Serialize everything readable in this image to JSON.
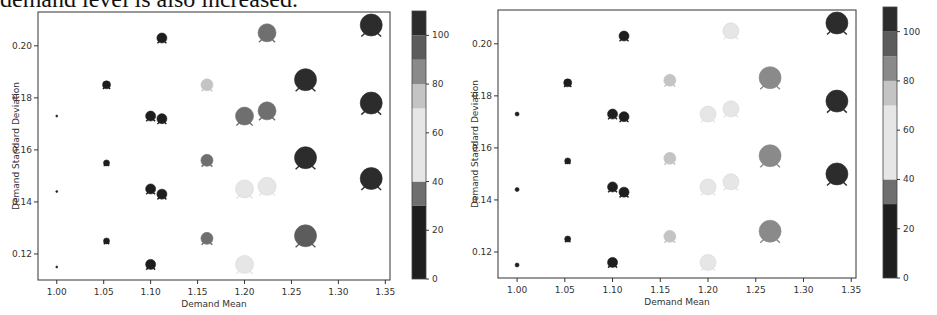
{
  "caption": "demand level is also increased.",
  "chart_data": [
    {
      "type": "scatter",
      "title": "",
      "xlabel": "Demand Mean",
      "ylabel": "Demand Standard Deviation",
      "xlim": [
        0.98,
        1.35
      ],
      "ylim": [
        0.11,
        0.213
      ],
      "xticks": [
        "1.00",
        "1.05",
        "1.10",
        "1.15",
        "1.20",
        "1.25",
        "1.30",
        "1.35"
      ],
      "yticks": [
        "0.12",
        "0.14",
        "0.16",
        "0.18",
        "0.20"
      ],
      "colorbar": {
        "min": 0,
        "max": 110,
        "ticks": [
          "0",
          "20",
          "40",
          "60",
          "80",
          "100"
        ]
      },
      "grid": false,
      "points": [
        {
          "x": 1.0,
          "y": 0.173,
          "value": 0,
          "size": 1
        },
        {
          "x": 1.0,
          "y": 0.144,
          "value": 0,
          "size": 1
        },
        {
          "x": 1.0,
          "y": 0.115,
          "value": 0,
          "size": 1
        },
        {
          "x": 1.053,
          "y": 0.185,
          "value": 15,
          "size": 4
        },
        {
          "x": 1.053,
          "y": 0.155,
          "value": 10,
          "size": 3
        },
        {
          "x": 1.053,
          "y": 0.125,
          "value": 10,
          "size": 3
        },
        {
          "x": 1.1,
          "y": 0.173,
          "value": 15,
          "size": 5
        },
        {
          "x": 1.112,
          "y": 0.172,
          "value": 15,
          "size": 5
        },
        {
          "x": 1.1,
          "y": 0.145,
          "value": 15,
          "size": 5
        },
        {
          "x": 1.112,
          "y": 0.143,
          "value": 15,
          "size": 5
        },
        {
          "x": 1.1,
          "y": 0.116,
          "value": 15,
          "size": 5
        },
        {
          "x": 1.112,
          "y": 0.203,
          "value": 15,
          "size": 5
        },
        {
          "x": 1.16,
          "y": 0.185,
          "value": 70,
          "size": 6
        },
        {
          "x": 1.16,
          "y": 0.156,
          "value": 38,
          "size": 6
        },
        {
          "x": 1.16,
          "y": 0.126,
          "value": 38,
          "size": 6
        },
        {
          "x": 1.2,
          "y": 0.173,
          "value": 35,
          "size": 9
        },
        {
          "x": 1.224,
          "y": 0.175,
          "value": 35,
          "size": 9
        },
        {
          "x": 1.2,
          "y": 0.145,
          "value": 55,
          "size": 9
        },
        {
          "x": 1.224,
          "y": 0.146,
          "value": 55,
          "size": 9
        },
        {
          "x": 1.2,
          "y": 0.116,
          "value": 55,
          "size": 9
        },
        {
          "x": 1.224,
          "y": 0.205,
          "value": 35,
          "size": 9
        },
        {
          "x": 1.265,
          "y": 0.187,
          "value": 100,
          "size": 11
        },
        {
          "x": 1.265,
          "y": 0.157,
          "value": 100,
          "size": 11
        },
        {
          "x": 1.265,
          "y": 0.127,
          "value": 90,
          "size": 11
        },
        {
          "x": 1.335,
          "y": 0.208,
          "value": 105,
          "size": 11
        },
        {
          "x": 1.335,
          "y": 0.178,
          "value": 105,
          "size": 11
        },
        {
          "x": 1.335,
          "y": 0.149,
          "value": 105,
          "size": 11
        }
      ]
    },
    {
      "type": "scatter",
      "title": "",
      "xlabel": "Demand Mean",
      "ylabel": "Demand Standard Deviation",
      "xlim": [
        0.98,
        1.35
      ],
      "ylim": [
        0.11,
        0.213
      ],
      "xticks": [
        "1.00",
        "1.05",
        "1.10",
        "1.15",
        "1.20",
        "1.25",
        "1.30",
        "1.35"
      ],
      "yticks": [
        "0.12",
        "0.14",
        "0.16",
        "0.18",
        "0.20"
      ],
      "colorbar": {
        "min": 0,
        "max": 110,
        "ticks": [
          "0",
          "20",
          "40",
          "60",
          "80",
          "100"
        ]
      },
      "grid": false,
      "points": [
        {
          "x": 1.0,
          "y": 0.173,
          "value": 5,
          "size": 2
        },
        {
          "x": 1.0,
          "y": 0.144,
          "value": 5,
          "size": 2
        },
        {
          "x": 1.0,
          "y": 0.115,
          "value": 5,
          "size": 2
        },
        {
          "x": 1.053,
          "y": 0.185,
          "value": 15,
          "size": 4
        },
        {
          "x": 1.053,
          "y": 0.155,
          "value": 10,
          "size": 3
        },
        {
          "x": 1.053,
          "y": 0.125,
          "value": 10,
          "size": 3
        },
        {
          "x": 1.1,
          "y": 0.173,
          "value": 15,
          "size": 5
        },
        {
          "x": 1.112,
          "y": 0.172,
          "value": 15,
          "size": 5
        },
        {
          "x": 1.1,
          "y": 0.145,
          "value": 15,
          "size": 5
        },
        {
          "x": 1.112,
          "y": 0.143,
          "value": 15,
          "size": 5
        },
        {
          "x": 1.1,
          "y": 0.116,
          "value": 15,
          "size": 5
        },
        {
          "x": 1.112,
          "y": 0.203,
          "value": 15,
          "size": 5
        },
        {
          "x": 1.16,
          "y": 0.186,
          "value": 70,
          "size": 6
        },
        {
          "x": 1.16,
          "y": 0.156,
          "value": 75,
          "size": 6
        },
        {
          "x": 1.16,
          "y": 0.126,
          "value": 78,
          "size": 6
        },
        {
          "x": 1.2,
          "y": 0.173,
          "value": 65,
          "size": 8
        },
        {
          "x": 1.224,
          "y": 0.175,
          "value": 65,
          "size": 8
        },
        {
          "x": 1.2,
          "y": 0.145,
          "value": 65,
          "size": 8
        },
        {
          "x": 1.224,
          "y": 0.147,
          "value": 65,
          "size": 8
        },
        {
          "x": 1.2,
          "y": 0.116,
          "value": 65,
          "size": 8
        },
        {
          "x": 1.224,
          "y": 0.205,
          "value": 65,
          "size": 8
        },
        {
          "x": 1.265,
          "y": 0.187,
          "value": 85,
          "size": 11
        },
        {
          "x": 1.265,
          "y": 0.157,
          "value": 88,
          "size": 11
        },
        {
          "x": 1.265,
          "y": 0.128,
          "value": 88,
          "size": 11
        },
        {
          "x": 1.335,
          "y": 0.208,
          "value": 100,
          "size": 11
        },
        {
          "x": 1.335,
          "y": 0.178,
          "value": 105,
          "size": 11
        },
        {
          "x": 1.335,
          "y": 0.15,
          "value": 105,
          "size": 11
        }
      ]
    }
  ]
}
